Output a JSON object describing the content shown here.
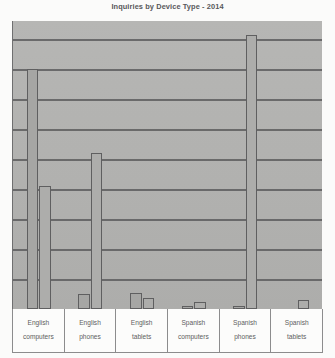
{
  "chart": {
    "title": "Inquiries by Device Type - 2014"
  },
  "chart_data": {
    "type": "bar",
    "title": "Inquiries by Device Type - 2014",
    "xlabel": "",
    "ylabel": "",
    "ylim": [
      0,
      9.6
    ],
    "grid": true,
    "gridlines": [
      1,
      2,
      3,
      4,
      5,
      6,
      7,
      8,
      9
    ],
    "legend_position": "none",
    "axis_tick_labels": [],
    "categories": [
      "English computers",
      "English phones",
      "English tablets",
      "Spanish computers",
      "Spanish phones",
      "Spanish tablets"
    ],
    "category_lines": [
      [
        "English",
        "computers"
      ],
      [
        "English",
        "phones"
      ],
      [
        "English",
        "tablets"
      ],
      [
        "Spanish",
        "computers"
      ],
      [
        "Spanish",
        "phones"
      ],
      [
        "Spanish",
        "tablets"
      ]
    ],
    "series": [
      {
        "name": "Series 1",
        "values": [
          8.0,
          0.5,
          0.55,
          0.1,
          0.1,
          0.0
        ]
      },
      {
        "name": "Series 2",
        "values": [
          4.1,
          5.2,
          0.38,
          0.22,
          9.15,
          0.3
        ]
      }
    ],
    "colors": {
      "plot_background": "#b4b4b2",
      "bar_fill": "#a9a9a7",
      "bar_border": "#5f5f60",
      "gridline": "#5d5d5e",
      "axis": "#6f6f70",
      "title_text": "#58585a",
      "label_text": "#5e5e60",
      "page_background": "#fbfbfa"
    }
  }
}
